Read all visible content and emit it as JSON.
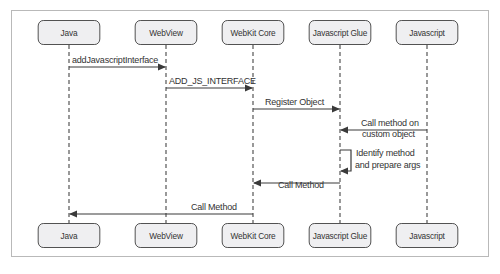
{
  "diagram": {
    "type": "sequence-diagram",
    "participants": [
      {
        "id": "java",
        "label": "Java",
        "x": 69
      },
      {
        "id": "webview",
        "label": "WebView",
        "x": 166
      },
      {
        "id": "webkit",
        "label": "WebKit Core",
        "x": 253
      },
      {
        "id": "glue",
        "label": "Javascript Glue",
        "x": 340
      },
      {
        "id": "javascript",
        "label": "Javascript",
        "x": 427
      }
    ],
    "messages": [
      {
        "from": "java",
        "to": "webview",
        "label": "addJavascriptInterface"
      },
      {
        "from": "webview",
        "to": "webkit",
        "label": "ADD_JS_INTERFACE"
      },
      {
        "from": "webkit",
        "to": "glue",
        "label": "Register Object"
      },
      {
        "from": "javascript",
        "to": "glue",
        "label_line1": "Call method on",
        "label_line2": "custom object"
      },
      {
        "from": "glue",
        "to": "glue",
        "label_line1": "Identify method",
        "label_line2": "and prepare args"
      },
      {
        "from": "glue",
        "to": "webkit",
        "label": "Call Method"
      },
      {
        "from": "webkit",
        "to": "java",
        "label": "Call Method"
      }
    ]
  },
  "colors": {
    "box_fill": "#efeff1",
    "box_border": "#4a4a4a",
    "line": "#4a4a4a",
    "frame": "#b9b9b9"
  }
}
